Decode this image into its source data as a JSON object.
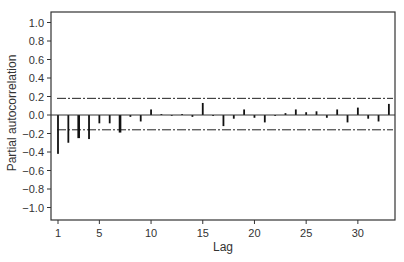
{
  "chart_data": {
    "type": "bar",
    "title": "",
    "xlabel": "Lag",
    "ylabel": "Partial autocorrelation",
    "xlim": [
      1,
      33
    ],
    "ylim": [
      -1.1,
      1.1
    ],
    "x_ticks": [
      1,
      5,
      10,
      15,
      20,
      25,
      30
    ],
    "y_ticks": [
      1.0,
      0.8,
      0.6,
      0.4,
      0.2,
      0.0,
      -0.2,
      -0.4,
      -0.6,
      -0.8,
      -1.0
    ],
    "y_tick_labels": [
      "1.0",
      "0.8",
      "0.6",
      "0.4",
      "0.2",
      "0.0",
      "−0.2",
      "−0.4",
      "−0.6",
      "−0.8",
      "−1.0"
    ],
    "grid": false,
    "legend": null,
    "lags": [
      1,
      2,
      3,
      4,
      5,
      6,
      7,
      8,
      9,
      10,
      11,
      12,
      13,
      14,
      15,
      16,
      17,
      18,
      19,
      20,
      21,
      22,
      23,
      24,
      25,
      26,
      27,
      28,
      29,
      30,
      31,
      32,
      33
    ],
    "values": [
      -0.42,
      -0.3,
      -0.25,
      -0.26,
      -0.09,
      -0.09,
      -0.19,
      -0.02,
      -0.07,
      0.06,
      0.01,
      0.0,
      0.01,
      -0.02,
      0.13,
      -0.01,
      -0.12,
      -0.04,
      0.06,
      -0.03,
      -0.08,
      -0.01,
      0.02,
      0.06,
      0.03,
      0.04,
      -0.03,
      0.06,
      -0.08,
      0.08,
      -0.04,
      -0.07,
      0.12
    ],
    "confidence_bounds": {
      "upper": 0.18,
      "lower": -0.16,
      "style": "dash-dot"
    }
  },
  "colors": {
    "bars": "#111111",
    "axes": "#333333",
    "bounds": "#222222"
  }
}
